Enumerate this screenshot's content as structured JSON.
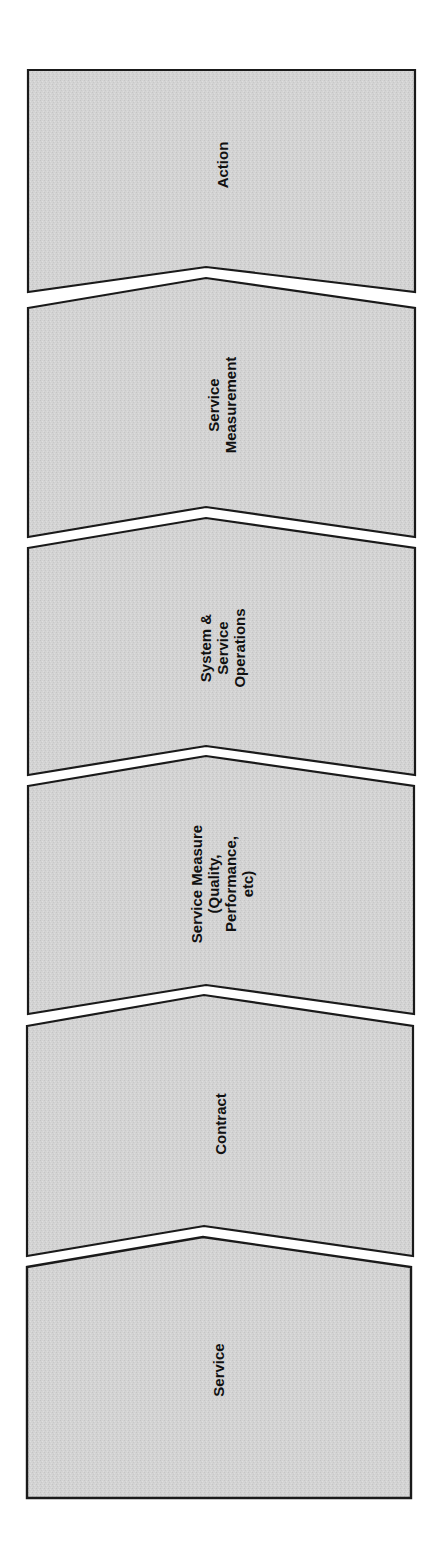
{
  "diagram": {
    "type": "vertical-chevron-process",
    "orientation": "bottom-to-top",
    "colors": {
      "fill": "#d3d3d3",
      "stroke": "#1a1a1a",
      "text": "#111111",
      "background": "#ffffff"
    },
    "steps": [
      {
        "order": 6,
        "name": "action",
        "lines": [
          "Action"
        ]
      },
      {
        "order": 5,
        "name": "service-measurement",
        "lines": [
          "Service",
          "Measurement"
        ]
      },
      {
        "order": 4,
        "name": "system-service-operations",
        "lines": [
          "System &",
          "Service",
          "Operations"
        ]
      },
      {
        "order": 3,
        "name": "service-measure",
        "lines": [
          "Service Measure",
          "(Quality,",
          "Performance,",
          "etc)"
        ]
      },
      {
        "order": 2,
        "name": "contract",
        "lines": [
          "Contract"
        ]
      },
      {
        "order": 1,
        "name": "service",
        "lines": [
          "Service"
        ]
      }
    ]
  }
}
